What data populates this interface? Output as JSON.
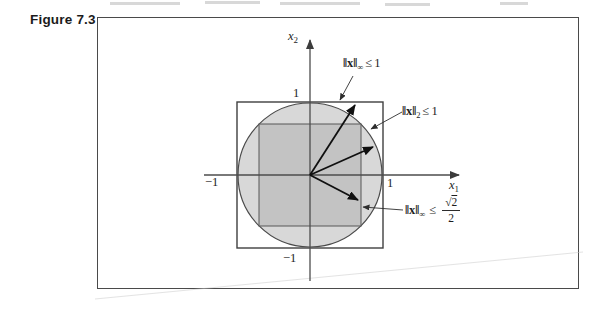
{
  "figure": {
    "label": "Figure 7.3"
  },
  "axes": {
    "x_label_base": "x",
    "x_label_sub": "1",
    "y_label_base": "x",
    "y_label_sub": "2",
    "ticks": {
      "x_pos": "1",
      "x_neg": "−1",
      "y_pos": "1",
      "y_neg": "−1"
    }
  },
  "annotations": {
    "inf_norm": {
      "norm": "‖x‖",
      "sub": "∞",
      "rel": "≤",
      "value": "1"
    },
    "two_norm": {
      "norm": "‖x‖",
      "sub": "2",
      "rel": "≤",
      "value": "1"
    },
    "inner_norm": {
      "norm": "‖x‖",
      "sub": "∞",
      "rel": "≤",
      "sqrt_sign": "√",
      "radicand": "2",
      "denominator": "2"
    }
  },
  "geometry_semantics": {
    "outer_square": "infinity-norm unit ball",
    "circle": "2-norm unit ball",
    "inner_square": "infinity-norm ball of radius sqrt(2)/2 inscribed in circle"
  },
  "colors": {
    "circle_fill": "#d8d8d8",
    "inner_square_fill": "#c3c3c3",
    "outline": "#3f3f3f"
  }
}
